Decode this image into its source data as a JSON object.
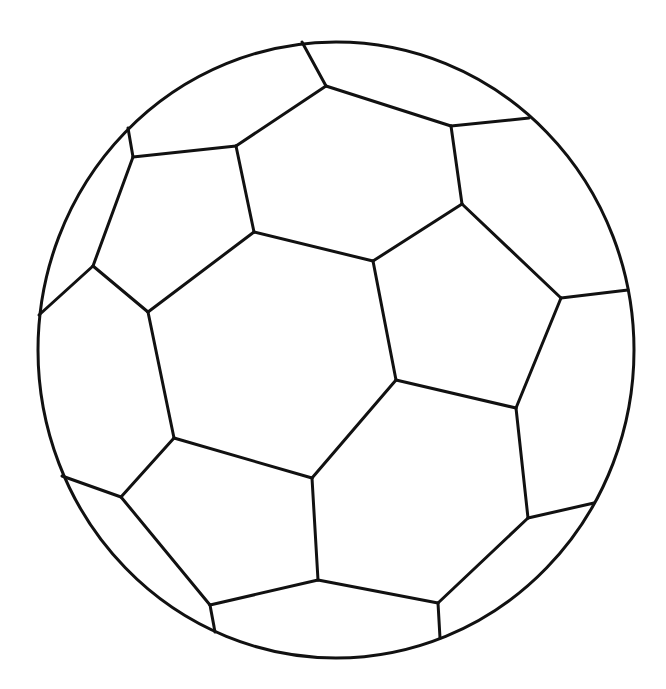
{
  "image": {
    "subject": "soccer ball line drawing",
    "background_color": "#ffffff",
    "line_color": "#111111",
    "outline": {
      "cx": 336,
      "cy": 350,
      "rx": 298,
      "ry": 308,
      "stroke_width": 3
    },
    "seam_stroke_width": 3
  }
}
